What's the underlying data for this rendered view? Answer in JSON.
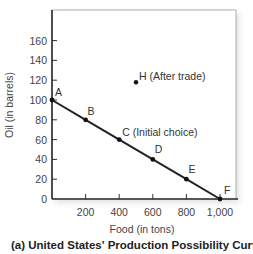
{
  "chart_data": {
    "type": "line",
    "title": "",
    "caption": "(a)  United States' Production Possibility Curve",
    "xlabel": "Food (in tons)",
    "ylabel": "Oil (in barrels)",
    "xlim": [
      0,
      1100
    ],
    "ylim": [
      0,
      175
    ],
    "x_ticks": [
      200,
      400,
      600,
      800,
      1000
    ],
    "x_tick_labels": [
      "200",
      "400",
      "600",
      "800",
      "1,000"
    ],
    "y_ticks": [
      0,
      20,
      40,
      60,
      80,
      100,
      120,
      140,
      160
    ],
    "y_tick_labels": [
      "0",
      "20",
      "40",
      "60",
      "80",
      "100",
      "120",
      "140",
      "160"
    ],
    "grid": false,
    "series": [
      {
        "name": "Production Possibility Curve",
        "x": [
          0,
          200,
          400,
          600,
          800,
          1000
        ],
        "y": [
          100,
          80,
          60,
          40,
          20,
          0
        ],
        "point_labels": [
          "A",
          "B",
          "C",
          "D",
          "E",
          "F"
        ]
      }
    ],
    "annotations": [
      {
        "point": "C",
        "x": 400,
        "y": 60,
        "text": "C",
        "note": "(Initial choice)"
      },
      {
        "point": "H",
        "x": 500,
        "y": 120,
        "text": "H",
        "note": "(After trade)"
      }
    ]
  }
}
